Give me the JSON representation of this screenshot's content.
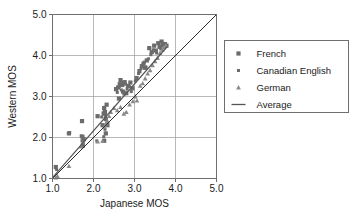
{
  "chart_data": {
    "type": "scatter",
    "title": "",
    "xlabel": "Japanese MOS",
    "ylabel": "Western MOS",
    "xlim": [
      1.0,
      5.0
    ],
    "ylim": [
      1.0,
      5.0
    ],
    "xticks": [
      "1.0",
      "2.0",
      "3.0",
      "4.0",
      "5.0"
    ],
    "yticks": [
      "1.0",
      "2.0",
      "3.0",
      "4.0",
      "5.0"
    ],
    "xtick_values": [
      1.0,
      2.0,
      3.0,
      4.0,
      5.0
    ],
    "ytick_values": [
      1.0,
      2.0,
      3.0,
      4.0,
      5.0
    ],
    "grid": true,
    "legend_position": "right",
    "legend": [
      {
        "label": "French",
        "marker": "square",
        "color": "#6b6b6b"
      },
      {
        "label": "Canadian English",
        "marker": "dot",
        "color": "#6b6b6b"
      },
      {
        "label": "German",
        "marker": "triangle",
        "color": "#8a8a8a"
      },
      {
        "label": "Average",
        "marker": "line",
        "color": "#555555"
      }
    ],
    "reference_line": {
      "name": "identity",
      "from": [
        1.0,
        1.0
      ],
      "to": [
        5.0,
        5.0
      ],
      "color": "#2b2b2b"
    },
    "average_line": {
      "name": "Average",
      "from": [
        1.0,
        1.02
      ],
      "to": [
        3.8,
        4.22
      ],
      "color": "#555555"
    },
    "series": [
      {
        "name": "French",
        "marker": "square",
        "color": "#6b6b6b",
        "points": [
          [
            1.08,
            1.28
          ],
          [
            1.4,
            2.1
          ],
          [
            1.72,
            2.4
          ],
          [
            1.73,
            2.02
          ],
          [
            1.76,
            1.96
          ],
          [
            1.74,
            1.8
          ],
          [
            2.1,
            2.52
          ],
          [
            2.22,
            2.3
          ],
          [
            2.25,
            2.58
          ],
          [
            2.26,
            2.72
          ],
          [
            2.28,
            2.62
          ],
          [
            2.3,
            2.45
          ],
          [
            2.32,
            2.8
          ],
          [
            2.34,
            2.3
          ],
          [
            2.3,
            2.1
          ],
          [
            2.26,
            1.92
          ],
          [
            2.55,
            3.18
          ],
          [
            2.6,
            3.22
          ],
          [
            2.62,
            2.95
          ],
          [
            2.64,
            3.3
          ],
          [
            2.66,
            3.4
          ],
          [
            2.7,
            3.28
          ],
          [
            2.72,
            3.12
          ],
          [
            2.76,
            3.35
          ],
          [
            2.8,
            3.08
          ],
          [
            2.84,
            3.26
          ],
          [
            2.9,
            3.34
          ],
          [
            2.95,
            3.2
          ],
          [
            3.05,
            3.45
          ],
          [
            3.12,
            3.62
          ],
          [
            3.18,
            3.74
          ],
          [
            3.22,
            3.8
          ],
          [
            3.26,
            3.7
          ],
          [
            3.3,
            3.88
          ],
          [
            3.36,
            4.18
          ],
          [
            3.42,
            4.08
          ],
          [
            3.48,
            4.24
          ],
          [
            3.52,
            4.12
          ],
          [
            3.58,
            4.3
          ],
          [
            3.62,
            4.22
          ],
          [
            3.66,
            4.34
          ],
          [
            3.7,
            4.26
          ],
          [
            3.74,
            4.28
          ],
          [
            3.78,
            4.24
          ]
        ]
      },
      {
        "name": "Canadian English",
        "marker": "dot",
        "color": "#6b6b6b",
        "points": [
          [
            1.1,
            1.22
          ],
          [
            1.42,
            2.12
          ],
          [
            1.7,
            2.04
          ],
          [
            1.72,
            1.92
          ],
          [
            1.75,
            1.86
          ],
          [
            2.08,
            1.92
          ],
          [
            2.2,
            2.5
          ],
          [
            2.24,
            2.6
          ],
          [
            2.27,
            2.66
          ],
          [
            2.29,
            2.54
          ],
          [
            2.31,
            2.44
          ],
          [
            2.33,
            2.36
          ],
          [
            2.28,
            2.2
          ],
          [
            2.25,
            2.02
          ],
          [
            2.58,
            3.1
          ],
          [
            2.63,
            3.24
          ],
          [
            2.68,
            3.16
          ],
          [
            2.71,
            3.34
          ],
          [
            2.74,
            3.06
          ],
          [
            2.78,
            3.3
          ],
          [
            2.82,
            3.18
          ],
          [
            2.88,
            3.24
          ],
          [
            2.92,
            3.12
          ],
          [
            3.02,
            3.38
          ],
          [
            3.1,
            3.56
          ],
          [
            3.16,
            3.68
          ],
          [
            3.2,
            3.76
          ],
          [
            3.24,
            3.84
          ],
          [
            3.28,
            3.72
          ],
          [
            3.34,
            3.92
          ],
          [
            3.4,
            4.02
          ],
          [
            3.46,
            4.14
          ],
          [
            3.54,
            4.06
          ],
          [
            3.6,
            4.2
          ],
          [
            3.64,
            4.16
          ],
          [
            3.68,
            4.3
          ],
          [
            3.72,
            4.22
          ],
          [
            3.76,
            4.26
          ]
        ]
      },
      {
        "name": "German",
        "marker": "triangle",
        "color": "#8a8a8a",
        "points": [
          [
            1.08,
            1.02
          ],
          [
            1.12,
            1.06
          ],
          [
            1.4,
            1.3
          ],
          [
            1.7,
            1.78
          ],
          [
            1.74,
            1.88
          ],
          [
            2.1,
            1.9
          ],
          [
            2.22,
            1.92
          ],
          [
            2.26,
            2.26
          ],
          [
            2.3,
            2.34
          ],
          [
            2.34,
            2.4
          ],
          [
            2.38,
            2.52
          ],
          [
            2.42,
            2.62
          ],
          [
            2.5,
            2.72
          ],
          [
            2.58,
            2.66
          ],
          [
            2.66,
            2.74
          ],
          [
            2.74,
            2.58
          ],
          [
            2.8,
            2.62
          ],
          [
            2.88,
            2.8
          ],
          [
            2.96,
            2.88
          ],
          [
            3.02,
            3.0
          ],
          [
            3.06,
            2.9
          ],
          [
            3.14,
            3.26
          ],
          [
            3.2,
            3.32
          ],
          [
            3.26,
            3.44
          ],
          [
            3.32,
            3.56
          ],
          [
            3.38,
            3.64
          ],
          [
            3.44,
            3.76
          ],
          [
            3.5,
            3.86
          ],
          [
            3.56,
            3.94
          ],
          [
            3.62,
            4.06
          ],
          [
            3.68,
            4.14
          ],
          [
            3.72,
            4.2
          ],
          [
            3.76,
            4.24
          ]
        ]
      }
    ]
  }
}
